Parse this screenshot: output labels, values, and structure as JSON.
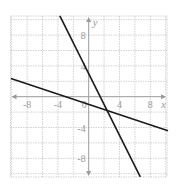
{
  "chart_data": {
    "type": "line",
    "title": "",
    "xlabel": "x",
    "ylabel": "y",
    "xlim": [
      -10,
      10
    ],
    "ylim": [
      -10.4,
      10.5
    ],
    "grid": true,
    "grid_step": 2,
    "x_ticks": [
      -8,
      -4,
      0,
      4,
      8
    ],
    "y_ticks": [
      8,
      4,
      -4,
      -8
    ],
    "series": [
      {
        "name": "steep line",
        "equation": "y = -2x + 3",
        "slope": -2,
        "intercept": 3,
        "points": [
          [
            -3.75,
            10.5
          ],
          [
            6.7,
            -10.4
          ]
        ]
      },
      {
        "name": "shallow line",
        "equation": "y = -x/3 - 1",
        "slope": -0.3333,
        "intercept": -1,
        "points": [
          [
            -10.1,
            2.37
          ],
          [
            10.3,
            -4.43
          ]
        ]
      }
    ],
    "annotations": [],
    "legend": null
  },
  "colors": {
    "grid": "#c8c8c8",
    "axis": "#9a9a9a",
    "line": "#1a1a1a",
    "background": "#ffffff"
  }
}
